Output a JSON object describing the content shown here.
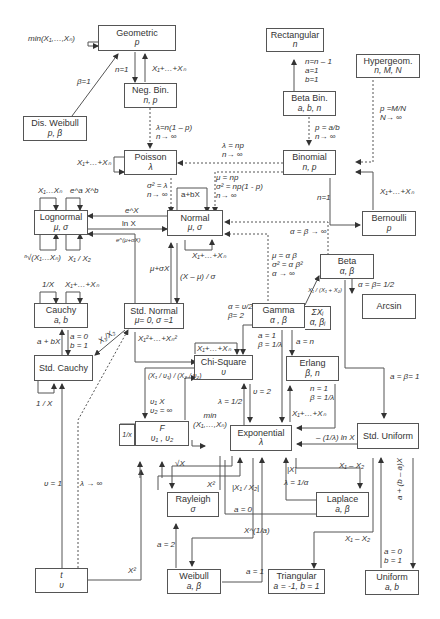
{
  "nodes": {
    "geometric": {
      "name": "Geometric",
      "params": "p"
    },
    "rectangular": {
      "name": "Rectangular",
      "params": "n"
    },
    "hypergeom": {
      "name": "Hypergeom.",
      "params": "n, M, N"
    },
    "dis_weibull": {
      "name": "Dis. Weibull",
      "params": "p, β"
    },
    "neg_bin": {
      "name": "Neg. Bin.",
      "params": "n, p"
    },
    "beta_bin": {
      "name": "Beta Bin.",
      "params": "a, b, n"
    },
    "poisson": {
      "name": "Poisson",
      "params": "λ"
    },
    "binomial": {
      "name": "Binomial",
      "params": "n, p"
    },
    "lognormal": {
      "name": "Lognormal",
      "params": "μ, σ"
    },
    "normal": {
      "name": "Normal",
      "params": "μ, σ"
    },
    "bernoulli": {
      "name": "Bernoulli",
      "params": "p"
    },
    "beta": {
      "name": "Beta",
      "params": "α, β"
    },
    "cauchy": {
      "name": "Cauchy",
      "params": "a, b"
    },
    "std_normal": {
      "name": "Std. Normal",
      "params": "μ= 0, σ =1"
    },
    "gamma": {
      "name": "Gamma",
      "params": "α , β"
    },
    "arcsin": {
      "name": "Arcsin",
      "params": ""
    },
    "std_cauchy": {
      "name": "Std. Cauchy",
      "params": ""
    },
    "chi_square": {
      "name": "Chi-Square",
      "params": "υ"
    },
    "erlang": {
      "name": "Erlang",
      "params": "β, n"
    },
    "f_dist": {
      "name": "F",
      "params": "υ₁ , υ₂"
    },
    "exponential": {
      "name": "Exponential",
      "params": "λ"
    },
    "std_uniform": {
      "name": "Std. Uniform",
      "params": ""
    },
    "rayleigh": {
      "name": "Rayleigh",
      "params": "σ"
    },
    "laplace": {
      "name": "Laplace",
      "params": "a, β"
    },
    "t_dist": {
      "name": "t",
      "params": "υ"
    },
    "weibull": {
      "name": "Weibull",
      "params": "a, β"
    },
    "triangular": {
      "name": "Triangular",
      "params": "a = -1, b = 1"
    },
    "uniform": {
      "name": "Uniform",
      "params": "a, b"
    }
  },
  "labels": {
    "geo_min": "min(X₁,…,Xₙ)",
    "geo_n1": "n=1",
    "geo_sum": "X₁+…+Xₙ",
    "disw_beta1": "β=1",
    "rect_cond": "n=n – 1\na=1\nb=1",
    "hyper_cond": "p =M/N\nN→ ∞",
    "negbin_pois": "λ=n(1 – p)\nn→ ∞",
    "betabin_bin": "p = a/b\nn→ ∞",
    "bin_pois": "λ = np\nn→ ∞",
    "pois_sum": "X₁+…+Xₙ",
    "pois_norm": "σ² = λ\nn→ ∞",
    "bin_norm": "μ = np\nσ² = np(1 - p)\nn→ ∞",
    "bin_bern": "n=1",
    "bern_sum": "X₁+…+Xₙ",
    "norm_affine": "a+bX",
    "logn_prod": "X₁…Xₙ",
    "logn_pow": "e^a X^b",
    "exp_x": "e^X",
    "ln_x": "ln X",
    "mu_sigma_exp": "e^(μ+σX)",
    "logn_root": "ⁿ√(X₁…Xₙ)",
    "logn_ratio": "X₁ / X₂",
    "norm_sum": "X₁+…+Xₙ",
    "beta_norm": "α = β → ∞",
    "gamma_norm": "μ = α β\nσ² = α β²\nα → ∞",
    "mu_sigma_x": "μ+σX",
    "std_x": "(X – μ) / σ",
    "cauchy_inv": "1/X",
    "cauchy_sum": "X₁+…+Xₙ",
    "cauchy_affine": "a + bX",
    "cauchy_cond": "a = 0\nb = 1",
    "normal_ratio": "X₁/X₂",
    "stdnorm_sq": "X₁²+…+Xₙ²",
    "gamma_beta": "X₁ / (X₁ + X₂)",
    "gamma_sum": "ΣXᵢ",
    "gamma_sum_p": "α, βᵢ",
    "beta_arcsin": "α = β= 1/2",
    "gamma_chi": "α = υ/2\nβ= 2",
    "gamma_exp": "a = 1\nβ = 1/λ",
    "gamma_erlang": "a = n",
    "chi_sum": "X₁+…+Xₙ",
    "beta_stdunif": "a = β= 1",
    "stdcauchy_inv": "1 / X",
    "chi_f": "(X₁ / υ₁) / (X₂ / υ₂)",
    "f_lim": "υ₁ X\nυ₂ = ∞",
    "chi_exp_lam": "λ = 1/2",
    "chi_exp_nu": "υ = 2",
    "erlang_cond": "n = 1\nβ = 1/λ",
    "exp_sum": "X₁+…+Xₙ",
    "f_inv": "1/x",
    "exp_min": "min\n(X₁,…,Xₙ)",
    "unif_exp": "– (1/λ) ln X",
    "sqrt_x": "√X",
    "x_sq": "X²",
    "abs_x": "|X|",
    "laplace_diff": "X₁ – X₂",
    "laplace_cond": "λ = 1/α",
    "ratio_abs": "|X₁ / X₂|",
    "a0": "a = 0",
    "t_nu1": "υ = 1",
    "t_lambda": "λ → ∞",
    "t_sq": "X²",
    "weib_a2": "a = 2",
    "weib_xpow": "X^(1/a)",
    "weib_a1": "a = 1",
    "tri_diff": "X₁ – X₂",
    "unif_cond": "a = 0\nb = 1",
    "unif_affine": "a + (b – a)X"
  }
}
